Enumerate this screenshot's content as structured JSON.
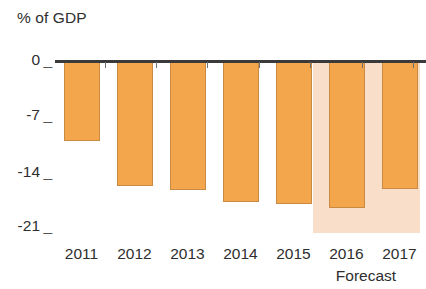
{
  "chart_data": {
    "type": "bar",
    "title": "",
    "subtitle": "",
    "ylabel": "% of GDP",
    "xlabel": "",
    "categories": [
      "2011",
      "2012",
      "2013",
      "2014",
      "2015",
      "2016",
      "2017"
    ],
    "values": [
      -10.1,
      -15.8,
      -16.2,
      -17.7,
      -18.0,
      -18.5,
      -16.1
    ],
    "series": [
      {
        "name": "% of GDP",
        "values": [
          -10.1,
          -15.8,
          -16.2,
          -17.7,
          -18.0,
          -18.5,
          -16.1
        ]
      }
    ],
    "ylim": [
      -21,
      0
    ],
    "ytick_labels": [
      "0",
      "-7",
      "-14",
      "-21"
    ],
    "ytick_values": [
      0,
      -7,
      -14,
      -21
    ],
    "grid": false,
    "legend": "none",
    "annotations": [
      {
        "text": "Forecast",
        "covers_categories": [
          "2016",
          "2017"
        ],
        "type": "shaded-region-label"
      }
    ],
    "colors": {
      "bar_fill": "#f4a64c",
      "bar_stroke": "#c98a42",
      "forecast_band": "#f9dfc9",
      "axis": "#3a3a3a",
      "text": "#2e2e2e",
      "background": "#ffffff"
    }
  },
  "labels": {
    "axis_title": "% of GDP",
    "forecast": "Forecast"
  }
}
